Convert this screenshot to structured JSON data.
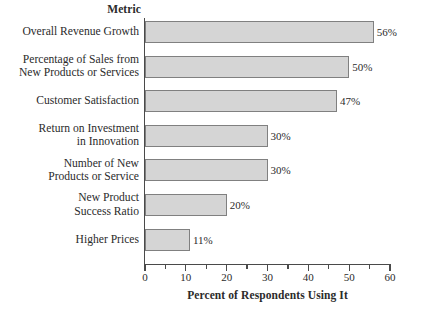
{
  "chart": {
    "metric_header": "Metric",
    "axis_title": "Percent of Respondents Using It",
    "tick_labels": [
      "0",
      "10",
      "20",
      "30",
      "40",
      "50",
      "60"
    ],
    "colors": {
      "bar_fill": "#d5d5d5",
      "bar_border": "#808080",
      "axis": "#4a4a4a",
      "text": "#2b2b2b",
      "background": "#ffffff"
    }
  },
  "chart_data": {
    "type": "bar",
    "orientation": "horizontal",
    "title": "",
    "xlabel": "Percent of Respondents Using It",
    "ylabel": "Metric",
    "xlim": [
      0,
      60
    ],
    "xticks": [
      0,
      10,
      20,
      30,
      40,
      50,
      60
    ],
    "minor_tick_interval": 5,
    "grid": false,
    "legend": false,
    "categories": [
      "Overall Revenue Growth",
      "Percentage of Sales from New Products or Services",
      "Customer Satisfaction",
      "Return on Investment in Innovation",
      "Number of New Products or Service",
      "New Product Success Ratio",
      "Higher Prices"
    ],
    "category_lines": [
      [
        "Overall Revenue Growth"
      ],
      [
        "Percentage of Sales from",
        "New Products or Services"
      ],
      [
        "Customer Satisfaction"
      ],
      [
        "Return on Investment",
        "in Innovation"
      ],
      [
        "Number of New",
        "Products or Service"
      ],
      [
        "New Product",
        "Success Ratio"
      ],
      [
        "Higher Prices"
      ]
    ],
    "values": [
      56,
      50,
      47,
      30,
      30,
      20,
      11
    ],
    "data_labels": [
      "56%",
      "50%",
      "47%",
      "30%",
      "30%",
      "20%",
      "11%"
    ]
  }
}
